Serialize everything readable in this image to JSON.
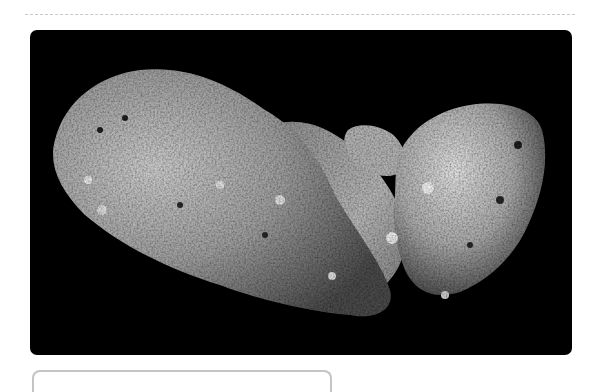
{
  "figure": {
    "alt": "Asteroid Itokawa on black background",
    "background_color": "#000000"
  },
  "caption": {
    "text": ""
  },
  "colors": {
    "divider": "#c8c8c8",
    "caption_border": "#c4c4c4"
  }
}
